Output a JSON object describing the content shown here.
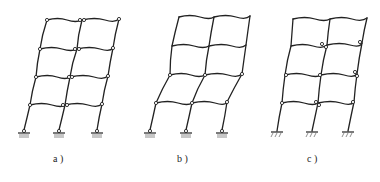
{
  "diagram": {
    "type": "frame-collapse-mechanisms",
    "panels": [
      {
        "id": "a",
        "label": "a )",
        "hinges": "beam ends at all levels",
        "support": "pinned-hatched"
      },
      {
        "id": "b",
        "label": "b )",
        "hinges": "lower two levels only",
        "support": "pinned-hatched"
      },
      {
        "id": "c",
        "label": "c )",
        "hinges": "column ends in lower three levels",
        "support": "fixed"
      }
    ]
  },
  "labels": {
    "a": "a )",
    "b": "b )",
    "c": "c )"
  },
  "colors": {
    "line": "#222222",
    "background": "#ffffff"
  }
}
